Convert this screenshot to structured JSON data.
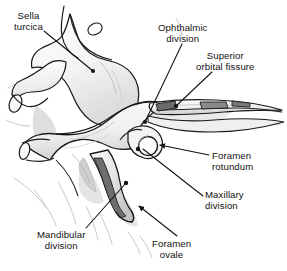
{
  "figure": {
    "background_color": "#ffffff",
    "line_color": "#1a1a1a",
    "fill_light": "#f2f2f2",
    "fill_mid": "#cfcfcf",
    "fill_dark": "#6e6e6e",
    "shadow_color": "#bdbdbd"
  },
  "labels": [
    {
      "id": "sella-turcica",
      "line1": "Sella",
      "line2": "turcica",
      "leader": "line-to-sella-turcica"
    },
    {
      "id": "ophthalmic-division",
      "line1": "Ophthalmic",
      "line2": "division",
      "leader": "line-to-ophthalmic-division"
    },
    {
      "id": "superior-orbital-fissure",
      "line1": "Superior",
      "line2": "orbital fissure",
      "leader": "line-to-superior-orbital-fissure"
    },
    {
      "id": "foramen-rotundum",
      "line1": "Foramen",
      "line2": "rotundum",
      "leader": "arrow-to-foramen-rotundum"
    },
    {
      "id": "maxillary-division",
      "line1": "Maxillary",
      "line2": "division",
      "leader": "line-to-maxillary-division"
    },
    {
      "id": "mandibular-division",
      "line1": "Mandibular",
      "line2": "division",
      "leader": "line-to-mandibular-division"
    },
    {
      "id": "foramen-ovale",
      "line1": "Foramen",
      "line2": "ovale",
      "leader": "arrow-to-foramen-ovale"
    }
  ]
}
